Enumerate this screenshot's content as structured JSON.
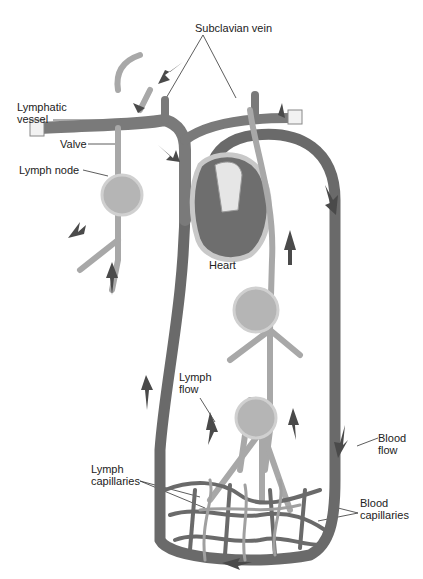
{
  "diagram": {
    "type": "anatomy",
    "colors": {
      "blood_vessel": "#7a7a7a",
      "blood_vessel_dark": "#5a5a5a",
      "lymph_vessel": "#a8a8a8",
      "lymph_node": "#b5b5b5",
      "arrow": "#4a4a4a",
      "heart": "#6e6e6e",
      "background": "#ffffff"
    },
    "labels": {
      "subclavian_vein": "Subclavian vein",
      "lymphatic_vessel_line1": "Lymphatic",
      "lymphatic_vessel_line2": "vessel",
      "valve": "Valve",
      "lymph_node": "Lymph node",
      "heart": "Heart",
      "lymph_flow_line1": "Lymph",
      "lymph_flow_line2": "flow",
      "blood_flow_line1": "Blood",
      "blood_flow_line2": "flow",
      "lymph_capillaries_line1": "Lymph",
      "lymph_capillaries_line2": "capillaries",
      "blood_capillaries_line1": "Blood",
      "blood_capillaries_line2": "capillaries"
    }
  }
}
